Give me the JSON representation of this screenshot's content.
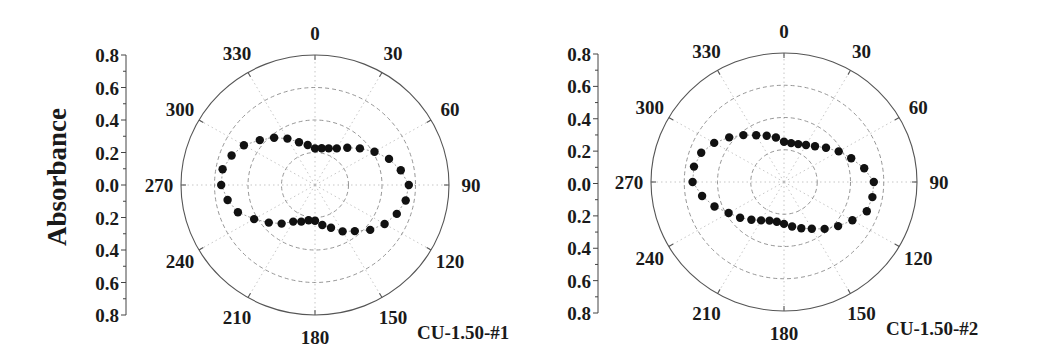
{
  "figure": {
    "ylabel": "Absorbance",
    "panels": [
      {
        "sample_label": "CU-1.50-#1"
      },
      {
        "sample_label": "CU-1.50-#2"
      }
    ]
  },
  "chart_data": [
    {
      "type": "scatter",
      "subtype": "polar",
      "title": "CU-1.50-#1",
      "ylabel": "Absorbance",
      "radial_ticks": [
        "0.8",
        "0.6",
        "0.4",
        "0.2",
        "0.0",
        "0.2",
        "0.4",
        "0.6",
        "0.8"
      ],
      "radial_range": [
        0,
        0.8
      ],
      "rings": [
        0.2,
        0.4,
        0.6,
        0.8
      ],
      "angle_ticks": [
        "0",
        "30",
        "60",
        "90",
        "120",
        "150",
        "180",
        "210",
        "240",
        "270",
        "300",
        "330"
      ],
      "angle_unit": "deg",
      "grid": true,
      "theta": [
        0,
        10,
        20,
        30,
        40,
        50,
        60,
        70,
        80,
        90,
        100,
        110,
        120,
        130,
        140,
        150,
        160,
        170,
        180,
        190,
        200,
        210,
        220,
        230,
        240,
        250,
        260,
        270,
        280,
        290,
        300,
        310,
        320,
        330,
        340,
        350
      ],
      "r": [
        0.225,
        0.23,
        0.24,
        0.26,
        0.3,
        0.35,
        0.41,
        0.47,
        0.52,
        0.56,
        0.55,
        0.52,
        0.48,
        0.43,
        0.37,
        0.33,
        0.28,
        0.25,
        0.22,
        0.22,
        0.24,
        0.26,
        0.31,
        0.36,
        0.42,
        0.49,
        0.53,
        0.56,
        0.56,
        0.53,
        0.49,
        0.43,
        0.38,
        0.33,
        0.28,
        0.25
      ]
    },
    {
      "type": "scatter",
      "subtype": "polar",
      "title": "CU-1.50-#2",
      "ylabel": "",
      "radial_ticks": [
        "0.8",
        "0.6",
        "0.4",
        "0.2",
        "0.0",
        "0.2",
        "0.4",
        "0.6",
        "0.8"
      ],
      "radial_range": [
        0,
        0.8
      ],
      "rings": [
        0.2,
        0.4,
        0.6,
        0.8
      ],
      "angle_ticks": [
        "0",
        "30",
        "60",
        "90",
        "120",
        "150",
        "180",
        "210",
        "240",
        "270",
        "300",
        "330"
      ],
      "angle_unit": "deg",
      "grid": true,
      "theta": [
        0,
        10,
        20,
        30,
        40,
        50,
        60,
        70,
        80,
        90,
        100,
        110,
        120,
        130,
        140,
        150,
        160,
        170,
        180,
        190,
        200,
        210,
        220,
        230,
        240,
        250,
        260,
        270,
        280,
        290,
        300,
        310,
        320,
        330,
        340,
        350
      ],
      "r": [
        0.25,
        0.245,
        0.25,
        0.265,
        0.29,
        0.33,
        0.38,
        0.43,
        0.49,
        0.54,
        0.54,
        0.53,
        0.475,
        0.425,
        0.38,
        0.335,
        0.305,
        0.28,
        0.26,
        0.25,
        0.255,
        0.275,
        0.305,
        0.345,
        0.385,
        0.445,
        0.5,
        0.55,
        0.55,
        0.53,
        0.485,
        0.43,
        0.38,
        0.335,
        0.305,
        0.28
      ]
    }
  ]
}
